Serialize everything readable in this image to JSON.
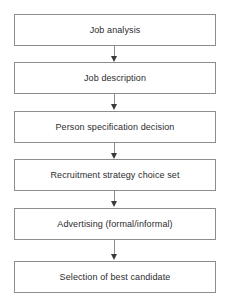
{
  "diagram": {
    "orientation": "vertical-top-to-bottom",
    "background_color": "#ffffff",
    "box_border_color": "#8d8d8d",
    "box_fill_color": "#ffffff",
    "text_color": "#2c2c2c",
    "arrow_color": "#8d8d8d",
    "arrowhead_color": "#3a3a3a",
    "nodes": [
      {
        "id": "job-analysis",
        "label": "Job analysis"
      },
      {
        "id": "job-description",
        "label": "Job description"
      },
      {
        "id": "person-specification-decision",
        "label": "Person specification decision"
      },
      {
        "id": "recruitment-strategy-choice-set",
        "label": "Recruitment strategy choice set"
      },
      {
        "id": "advertising-formal-informal",
        "label": "Advertising (formal/informal)"
      },
      {
        "id": "selection-of-best-candidate",
        "label": "Selection of best candidate"
      }
    ],
    "connectors": [
      {
        "from": "job-analysis",
        "to": "job-description",
        "icon": "arrow-down-icon"
      },
      {
        "from": "job-description",
        "to": "person-specification-decision",
        "icon": "arrow-down-icon"
      },
      {
        "from": "person-specification-decision",
        "to": "recruitment-strategy-choice-set",
        "icon": "arrow-down-icon"
      },
      {
        "from": "recruitment-strategy-choice-set",
        "to": "advertising-formal-informal",
        "icon": "arrow-down-icon"
      },
      {
        "from": "advertising-formal-informal",
        "to": "selection-of-best-candidate",
        "icon": "arrow-down-icon"
      }
    ]
  }
}
